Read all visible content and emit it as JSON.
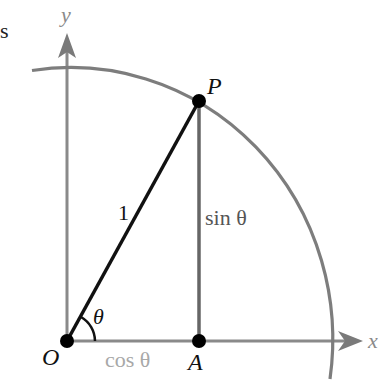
{
  "diagram": {
    "type": "unit-circle-trig",
    "labels": {
      "corner_fragment": "s",
      "y_axis": "y",
      "x_axis": "x",
      "origin": "O",
      "point_p": "P",
      "point_a": "A",
      "hypotenuse": "1",
      "opposite": "sin θ",
      "adjacent": "cos θ",
      "angle": "θ"
    },
    "colors": {
      "axis": "#8a8a8a",
      "arc": "#7d7d7d",
      "hypotenuse": "#111111",
      "sine_segment": "#666666",
      "cosine_segment": "#8a8a8a",
      "points": "#000000",
      "cos_label": "#a8a8a8",
      "sin_label": "#555555"
    },
    "geometry": {
      "origin": [
        67,
        341
      ],
      "P": [
        199,
        101
      ],
      "A": [
        199,
        341
      ],
      "arc_radius_x": 262,
      "arc_radius_y": 272
    }
  }
}
